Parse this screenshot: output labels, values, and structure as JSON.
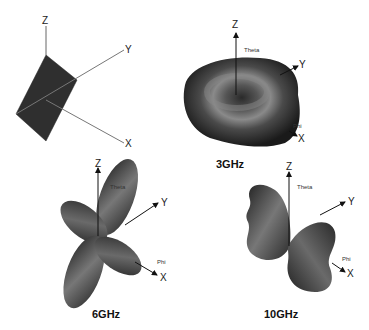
{
  "figure": {
    "panels": [
      {
        "id": "antenna",
        "axes": {
          "z": "Z",
          "y": "Y",
          "x": "X"
        }
      },
      {
        "id": "3ghz",
        "label": "3GHz",
        "axes": {
          "z": "Z",
          "y": "Y",
          "x": "X"
        },
        "theta": "Theta",
        "phi": "Phi"
      },
      {
        "id": "6ghz",
        "label": "6GHz",
        "axes": {
          "z": "Z",
          "y": "Y",
          "x": "X"
        },
        "theta": "Theta",
        "phi": "Phi"
      },
      {
        "id": "10ghz",
        "label": "10GHz",
        "axes": {
          "z": "Z",
          "y": "Y",
          "x": "X"
        },
        "theta": "Theta",
        "phi": "Phi"
      }
    ]
  }
}
